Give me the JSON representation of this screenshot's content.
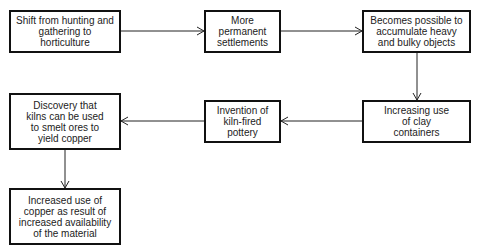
{
  "diagram": {
    "type": "flowchart",
    "nodes": [
      {
        "id": "n1",
        "label": "Shift from hunting and gathering to horticulture"
      },
      {
        "id": "n2",
        "label": "More permanent settlements"
      },
      {
        "id": "n3",
        "label": "Becomes possible to accumulate heavy and bulky objects"
      },
      {
        "id": "n4",
        "label": "Increasing use of clay containers"
      },
      {
        "id": "n5",
        "label": "Invention of kiln-fired pottery"
      },
      {
        "id": "n6",
        "label": "Discovery that kilns can be used to smelt ores to yield copper"
      },
      {
        "id": "n7",
        "label": "Increased use of copper as result of increased availability of the material"
      }
    ],
    "edges": [
      {
        "from": "n1",
        "to": "n2"
      },
      {
        "from": "n2",
        "to": "n3"
      },
      {
        "from": "n3",
        "to": "n4"
      },
      {
        "from": "n4",
        "to": "n5"
      },
      {
        "from": "n5",
        "to": "n6"
      },
      {
        "from": "n6",
        "to": "n7"
      }
    ],
    "colors": {
      "stroke": "#111111",
      "text": "#222222",
      "background": "#ffffff"
    }
  }
}
